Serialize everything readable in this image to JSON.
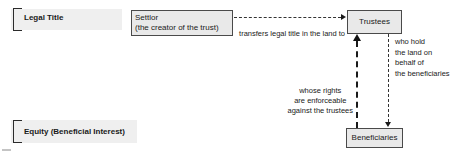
{
  "sections": [
    {
      "id": "legal-title",
      "label": "Legal Title"
    },
    {
      "id": "equity",
      "label": "Equity (Beneficial Interest)"
    }
  ],
  "nodes": {
    "settlor": {
      "line1": "Settlor",
      "line2": "(the creator of the trust)"
    },
    "trustees": {
      "label": "Trustees"
    },
    "beneficiaries": {
      "label": "Beneficiaries"
    }
  },
  "edges": {
    "transfer": {
      "label": "transfers legal title in the land to"
    },
    "hold": {
      "label": "who hold\nthe land on\nbehalf of\nthe beneficiaries"
    },
    "enforce": {
      "label": "whose rights\nare enforceable\nagainst the trustees"
    }
  },
  "colors": {
    "box_fill": "#e9e9e9",
    "box_border": "#4a4a4a",
    "section_highlight": "#efefef",
    "line": "#333333",
    "text": "#1a1a1a",
    "background": "#ffffff"
  }
}
